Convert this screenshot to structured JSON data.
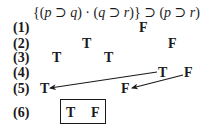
{
  "formula": {
    "parts": [
      "{(",
      "p",
      " ⊃ ",
      "q",
      ") · (",
      "q",
      " ⊃ ",
      "r",
      ")} ⊃ (",
      "p",
      " ⊃ ",
      "r",
      ")"
    ]
  },
  "rows": [
    {
      "label": "(1)",
      "values": [
        {
          "text": "F",
          "x": 139,
          "y": 21
        }
      ]
    },
    {
      "label": "(2)",
      "values": [
        {
          "text": "T",
          "x": 82,
          "y": 37
        },
        {
          "text": "F",
          "x": 168,
          "y": 37
        }
      ]
    },
    {
      "label": "(3)",
      "values": [
        {
          "text": "T",
          "x": 52,
          "y": 51
        },
        {
          "text": "T",
          "x": 104,
          "y": 51
        }
      ]
    },
    {
      "label": "(4)",
      "values": [
        {
          "text": "T",
          "x": 158,
          "y": 66
        },
        {
          "text": "F",
          "x": 184,
          "y": 66
        }
      ]
    },
    {
      "label": "(5)",
      "values": [
        {
          "text": "T",
          "x": 40,
          "y": 82
        },
        {
          "text": "F",
          "x": 121,
          "y": 82
        }
      ]
    },
    {
      "label": "(6)",
      "values": [
        {
          "text": "T",
          "x": 66,
          "y": 106
        },
        {
          "text": "F",
          "x": 91,
          "y": 106
        }
      ]
    }
  ],
  "arrows": [
    {
      "from": [
        157,
        72
      ],
      "to": [
        50,
        89
      ]
    },
    {
      "from": [
        183,
        75
      ],
      "to": [
        132,
        89
      ]
    }
  ],
  "result_box": {
    "x": 60,
    "y": 99,
    "w": 46,
    "h": 25
  }
}
